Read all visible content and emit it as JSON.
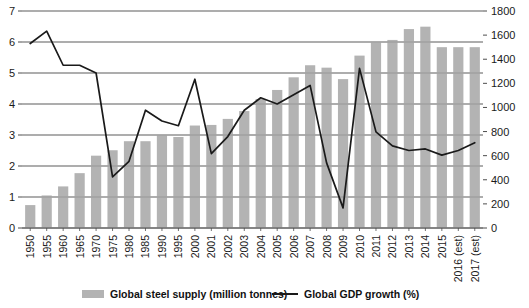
{
  "chart_data": {
    "type": "bar",
    "title": "",
    "subtitle": "",
    "xlabel": "",
    "ylabel": "",
    "y2label": "",
    "grid": true,
    "legend_position": "bottom",
    "categories": [
      "1950",
      "1955",
      "1960",
      "1965",
      "1970",
      "1975",
      "1980",
      "1985",
      "1990",
      "1995",
      "2000",
      "2001",
      "2002",
      "2003",
      "2004",
      "2005",
      "2006",
      "2007",
      "2008",
      "2009",
      "2010",
      "2011",
      "2012",
      "2013",
      "2014",
      "2015",
      "2016 (est)",
      "2017 (est)"
    ],
    "left_axis": {
      "label": "Global GDP growth (%)",
      "ticks": [
        "0",
        "1",
        "2",
        "3",
        "4",
        "5",
        "6",
        "7"
      ],
      "tick_values": [
        0,
        1,
        2,
        3,
        4,
        5,
        6,
        7
      ],
      "ylim": [
        0,
        7
      ]
    },
    "right_axis": {
      "label": "Global steel supply (million tonnes)",
      "ticks": [
        "0",
        "200",
        "400",
        "600",
        "800",
        "1000",
        "1200",
        "1400",
        "1600",
        "1800"
      ],
      "tick_values": [
        0,
        200,
        400,
        600,
        800,
        1000,
        1200,
        1400,
        1600,
        1800
      ],
      "ylim": [
        0,
        1800
      ]
    },
    "series": [
      {
        "name": "Global steel supply (million tonnes)",
        "type": "bar",
        "axis": "right",
        "color": "#b3b3b3",
        "values": [
          190,
          270,
          345,
          455,
          600,
          645,
          720,
          720,
          770,
          755,
          850,
          855,
          905,
          970,
          1070,
          1145,
          1250,
          1350,
          1330,
          1235,
          1430,
          1540,
          1560,
          1650,
          1670,
          1500,
          1500,
          1500
        ]
      },
      {
        "name": "Global GDP growth (%)",
        "type": "line",
        "axis": "left",
        "color": "#1a1a1a",
        "values": [
          5.95,
          6.35,
          5.25,
          5.25,
          5.0,
          1.65,
          2.15,
          3.8,
          3.45,
          3.3,
          4.8,
          2.4,
          2.95,
          3.8,
          4.2,
          4.0,
          4.3,
          4.6,
          2.1,
          0.65,
          5.15,
          3.1,
          2.65,
          2.5,
          2.55,
          2.35,
          2.5,
          2.75
        ]
      }
    ]
  },
  "legend": {
    "items": [
      {
        "label": "Global steel supply (million tonnes)",
        "marker": "swatch",
        "color": "#b3b3b3"
      },
      {
        "label": "Global GDP growth (%)",
        "marker": "line",
        "color": "#1a1a1a"
      }
    ]
  },
  "colors": {
    "bar": "#b3b3b3",
    "line": "#1a1a1a",
    "grid": "#808080",
    "axis": "#4d4d4d",
    "background": "#ffffff",
    "text": "#1a1a1a"
  }
}
